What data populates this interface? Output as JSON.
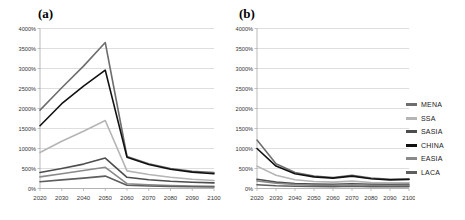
{
  "figure": {
    "width": 465,
    "height": 220,
    "background": "#ffffff"
  },
  "legend": {
    "position": "right",
    "entries": [
      {
        "label": "MENA",
        "color": "#6e6e6e"
      },
      {
        "label": "SSA",
        "color": "#b5b5b5"
      },
      {
        "label": "SASIA",
        "color": "#4d4d4d"
      },
      {
        "label": "CHINA",
        "color": "#111111"
      },
      {
        "label": "EASIA",
        "color": "#8a8a8a"
      },
      {
        "label": "LACA",
        "color": "#5e5e5e"
      }
    ]
  },
  "panels": [
    {
      "id": "panel-a",
      "title": "(a)"
    },
    {
      "id": "panel-b",
      "title": "(b)"
    }
  ],
  "chart_data": [
    {
      "id": "panel-a",
      "type": "line",
      "title": "(a)",
      "xlabel": "",
      "ylabel": "",
      "grid": true,
      "legend_position": "right",
      "x": [
        2020,
        2030,
        2040,
        2050,
        2060,
        2070,
        2080,
        2090,
        2100
      ],
      "xtick_labels": [
        "2020",
        "2030",
        "2040",
        "2050",
        "2060",
        "2070",
        "2080",
        "2090",
        "2100"
      ],
      "ylim": [
        0,
        4000
      ],
      "ytick_labels": [
        "0%",
        "500%",
        "1000%",
        "1500%",
        "2000%",
        "2500%",
        "3000%",
        "3500%",
        "4000%"
      ],
      "yticks": [
        0,
        500,
        1000,
        1500,
        2000,
        2500,
        3000,
        3500,
        4000
      ],
      "yunit": "%",
      "series": [
        {
          "name": "MENA",
          "color": "#6e6e6e",
          "values": [
            1960,
            2520,
            3060,
            3650,
            800,
            620,
            500,
            430,
            400
          ]
        },
        {
          "name": "SSA",
          "color": "#b5b5b5",
          "values": [
            900,
            1180,
            1430,
            1700,
            440,
            350,
            280,
            230,
            200
          ]
        },
        {
          "name": "SASIA",
          "color": "#4d4d4d",
          "values": [
            400,
            500,
            610,
            760,
            280,
            220,
            180,
            155,
            140
          ]
        },
        {
          "name": "CHINA",
          "color": "#111111",
          "values": [
            1570,
            2120,
            2560,
            2960,
            780,
            600,
            480,
            410,
            370
          ]
        },
        {
          "name": "EASIA",
          "color": "#8a8a8a",
          "values": [
            290,
            370,
            450,
            530,
            120,
            95,
            75,
            62,
            55
          ]
        },
        {
          "name": "LACA",
          "color": "#5e5e5e",
          "values": [
            170,
            215,
            260,
            310,
            80,
            62,
            50,
            42,
            38
          ]
        }
      ]
    },
    {
      "id": "panel-b",
      "type": "line",
      "title": "(b)",
      "xlabel": "",
      "ylabel": "",
      "grid": true,
      "legend_position": "right",
      "x": [
        2020,
        2030,
        2040,
        2050,
        2060,
        2070,
        2080,
        2090,
        2100
      ],
      "xtick_labels": [
        "2020",
        "2030",
        "2040",
        "2050",
        "2060",
        "2070",
        "2080",
        "2090",
        "2100"
      ],
      "ylim": [
        0,
        4000
      ],
      "ytick_labels": [
        "0%",
        "500%",
        "1000%",
        "1500%",
        "2000%",
        "2500%",
        "3000%",
        "3500%",
        "4000%"
      ],
      "yticks": [
        0,
        500,
        1000,
        1500,
        2000,
        2500,
        3000,
        3500,
        4000
      ],
      "yunit": "%",
      "series": [
        {
          "name": "MENA",
          "color": "#6e6e6e",
          "values": [
            1210,
            620,
            400,
            310,
            275,
            330,
            260,
            230,
            240
          ]
        },
        {
          "name": "SSA",
          "color": "#b5b5b5",
          "values": [
            560,
            330,
            220,
            175,
            160,
            185,
            150,
            140,
            145
          ]
        },
        {
          "name": "SASIA",
          "color": "#4d4d4d",
          "values": [
            230,
            160,
            125,
            110,
            105,
            120,
            105,
            100,
            105
          ]
        },
        {
          "name": "CHINA",
          "color": "#111111",
          "values": [
            1000,
            560,
            370,
            290,
            260,
            310,
            245,
            215,
            225
          ]
        },
        {
          "name": "EASIA",
          "color": "#8a8a8a",
          "values": [
            190,
            130,
            100,
            85,
            80,
            95,
            80,
            75,
            80
          ]
        },
        {
          "name": "LACA",
          "color": "#5e5e5e",
          "values": [
            95,
            70,
            58,
            50,
            48,
            55,
            48,
            45,
            48
          ]
        }
      ]
    }
  ]
}
